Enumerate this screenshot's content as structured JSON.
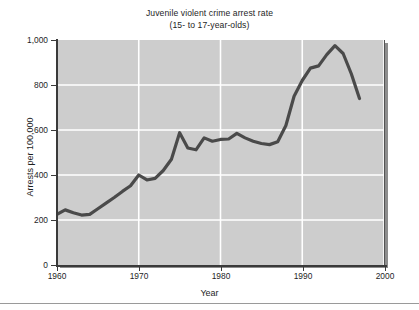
{
  "figure": {
    "background_color": "#ffffff",
    "plot_background_color": "#cdcdcd",
    "gridline_color": "#ffffff",
    "line_color": "#4a4a4a",
    "axis_color": "#3a3a3a"
  },
  "chart_data": {
    "type": "line",
    "title": "Juvenile violent crime arrest rate",
    "subtitle": "(15- to 17-year-olds)",
    "xlabel": "Year",
    "ylabel": "Arrests per 100,000",
    "xlim": [
      1960,
      2000
    ],
    "ylim": [
      0,
      1000
    ],
    "xticks": [
      1960,
      1970,
      1980,
      1990,
      2000
    ],
    "xticklabels": [
      "1960",
      "1970",
      "1980",
      "1990",
      "2000"
    ],
    "yticks": [
      0,
      200,
      400,
      600,
      800,
      1000
    ],
    "yticklabels": [
      "0",
      "200",
      "400",
      "600",
      "800",
      "1,000"
    ],
    "grid": true,
    "grid_axis": "both",
    "legend": false,
    "series": [
      {
        "name": "Juvenile violent crime arrest rate",
        "x": [
          1960,
          1961,
          1962,
          1963,
          1964,
          1965,
          1966,
          1967,
          1968,
          1969,
          1970,
          1971,
          1972,
          1973,
          1974,
          1975,
          1976,
          1977,
          1978,
          1979,
          1980,
          1981,
          1982,
          1983,
          1984,
          1985,
          1986,
          1987,
          1988,
          1989,
          1990,
          1991,
          1992,
          1993,
          1994,
          1995,
          1996,
          1997
        ],
        "values": [
          225,
          245,
          232,
          222,
          225,
          250,
          275,
          300,
          327,
          352,
          400,
          378,
          385,
          420,
          470,
          588,
          520,
          512,
          565,
          550,
          558,
          560,
          585,
          565,
          550,
          540,
          535,
          548,
          620,
          750,
          820,
          875,
          885,
          935,
          975,
          940,
          850,
          740
        ]
      }
    ]
  }
}
